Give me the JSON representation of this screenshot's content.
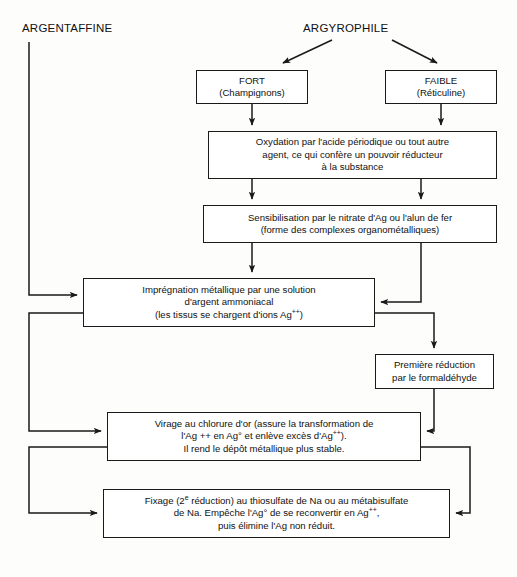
{
  "diagram": {
    "type": "flowchart",
    "title_left": "ARGENTAFFINE",
    "title_right": "ARGYROPHILE",
    "headings": [
      {
        "id": "argentaffine",
        "label": "ARGENTAFFINE"
      },
      {
        "id": "argyrophile",
        "label": "ARGYROPHILE"
      }
    ],
    "nodes": [
      {
        "id": "fort",
        "lines": [
          "FORT",
          "(Champignons)"
        ],
        "x": 196,
        "y": 70,
        "w": 112,
        "h": 34
      },
      {
        "id": "faible",
        "lines": [
          "FAIBLE",
          "(Réticuline)"
        ],
        "x": 385,
        "y": 70,
        "w": 112,
        "h": 34
      },
      {
        "id": "oxydation",
        "lines": [
          "Oxydation par l'acide périodique ou tout autre",
          "agent, ce qui confère un pouvoir réducteur",
          "à la substance"
        ],
        "x": 208,
        "y": 131,
        "w": 289,
        "h": 48
      },
      {
        "id": "sensibilisation",
        "lines": [
          "Sensibilisation par le nitrate d'Ag ou l'alun de fer",
          "(forme des complexes organométalliques)"
        ],
        "x": 203,
        "y": 205,
        "w": 294,
        "h": 38
      },
      {
        "id": "impregnation",
        "lines": [
          "Imprégnation métallique par une solution",
          "d'argent ammoniacal",
          "(les tissus se chargent d'ions Ag<sup>++</sup>)"
        ],
        "x": 83,
        "y": 278,
        "w": 292,
        "h": 49
      },
      {
        "id": "premiere-reduction",
        "lines": [
          "Première réduction",
          "par le formaldéhyde"
        ],
        "x": 375,
        "y": 354,
        "w": 119,
        "h": 35
      },
      {
        "id": "virage",
        "lines": [
          "Virage au chlorure d'or (assure la transformation de",
          "l'Ag ++ en Ag° et enlève excès d'Ag<sup>++</sup>).",
          "Il rend le dépôt métallique plus stable."
        ],
        "x": 107,
        "y": 412,
        "w": 314,
        "h": 49
      },
      {
        "id": "fixage",
        "lines": [
          "Fixage (2<sup>e</sup> réduction) au thiosulfate de Na ou au métabisulfate",
          "de Na. Empêche l'Ag° de se reconvertir en Ag<sup>++</sup>,",
          "puis élimine l'Ag non réduit."
        ],
        "x": 103,
        "y": 489,
        "w": 347,
        "h": 49
      }
    ],
    "edges": [
      {
        "id": "argyrophile-to-fort",
        "from": "argyrophile",
        "to": "fort",
        "style": "diagonal-arrow"
      },
      {
        "id": "argyrophile-to-faible",
        "from": "argyrophile",
        "to": "faible",
        "style": "diagonal-arrow"
      },
      {
        "id": "fort-to-oxydation",
        "from": "fort",
        "to": "oxydation",
        "style": "vertical-arrow"
      },
      {
        "id": "faible-to-oxydation",
        "from": "faible",
        "to": "oxydation",
        "style": "vertical-arrow"
      },
      {
        "id": "oxydation-to-sensibilisation-left",
        "from": "oxydation",
        "to": "sensibilisation",
        "style": "vertical-arrow"
      },
      {
        "id": "oxydation-to-sensibilisation-right",
        "from": "oxydation",
        "to": "sensibilisation",
        "style": "vertical-arrow"
      },
      {
        "id": "sensibilisation-to-impregnation",
        "from": "sensibilisation",
        "to": "impregnation",
        "style": "vertical-arrow"
      },
      {
        "id": "sensibilisation-to-impregnation-right",
        "from": "sensibilisation",
        "to": "impregnation",
        "style": "elbow-arrow"
      },
      {
        "id": "argentaffine-to-impregnation",
        "from": "argentaffine",
        "to": "impregnation",
        "style": "elbow-arrow"
      },
      {
        "id": "impregnation-to-premiere",
        "from": "impregnation",
        "to": "premiere-reduction",
        "style": "elbow-arrow"
      },
      {
        "id": "impregnation-to-virage",
        "from": "impregnation",
        "to": "virage",
        "style": "elbow-arrow"
      },
      {
        "id": "premiere-to-virage",
        "from": "premiere-reduction",
        "to": "virage",
        "style": "elbow-arrow"
      },
      {
        "id": "virage-to-fixage",
        "from": "virage",
        "to": "fixage",
        "style": "elbow-arrow"
      },
      {
        "id": "virage-right-to-fixage",
        "from": "virage",
        "to": "fixage",
        "style": "elbow-arrow"
      }
    ],
    "colors": {
      "line": "#1a1a1a",
      "box_fill": "#ffffff",
      "text": "#111111",
      "background": "#fdfdfc"
    },
    "caption": ""
  }
}
